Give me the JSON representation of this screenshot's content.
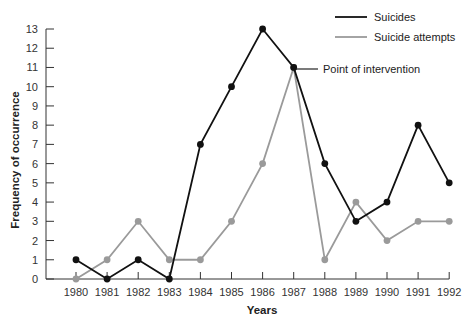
{
  "chart_data": {
    "type": "line",
    "title": "",
    "xlabel": "Years",
    "ylabel": "Frequency of occurrence",
    "categories": [
      "1980",
      "1981",
      "1982",
      "1983",
      "1984",
      "1985",
      "1986",
      "1987",
      "1988",
      "1989",
      "1990",
      "1991",
      "1992"
    ],
    "y_ticks": [
      0,
      1,
      2,
      3,
      4,
      5,
      6,
      7,
      8,
      9,
      10,
      11,
      12,
      13
    ],
    "ylim": [
      0,
      13
    ],
    "grid": false,
    "legend_position": "top-right",
    "series": [
      {
        "name": "Suicides",
        "color": "#111111",
        "values": [
          1,
          0,
          1,
          0,
          7,
          10,
          13,
          11,
          6,
          3,
          4,
          8,
          5
        ]
      },
      {
        "name": "Suicide attempts",
        "color": "#9a9a9a",
        "values": [
          0,
          1,
          3,
          1,
          1,
          3,
          6,
          11,
          1,
          4,
          2,
          3,
          3
        ]
      }
    ],
    "annotations": [
      {
        "text": "Point of intervention",
        "x": "1987",
        "y": 11
      }
    ]
  }
}
